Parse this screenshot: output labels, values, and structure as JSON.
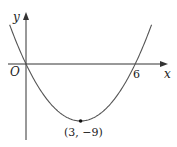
{
  "chart_data": {
    "type": "line",
    "title": "",
    "function": "y = x^2 - 6x",
    "xlabel": "x",
    "ylabel": "y",
    "origin_label": "O",
    "x_intercepts": [
      0,
      6
    ],
    "x_tick_labels": [
      "6"
    ],
    "vertex": {
      "x": 3,
      "y": -9,
      "label": "(3, −9)"
    },
    "xlim": [
      -1,
      7.7
    ],
    "ylim": [
      -12,
      8
    ],
    "grid": false,
    "legend": "none",
    "series": [
      {
        "name": "parabola",
        "x": [
          -1,
          0,
          1,
          2,
          3,
          4,
          5,
          6,
          7
        ],
        "values": [
          7,
          0,
          -5,
          -8,
          -9,
          -8,
          -5,
          0,
          7
        ]
      }
    ]
  },
  "colors": {
    "curve": "#555555",
    "axes": "#333333",
    "text": "#222222"
  }
}
